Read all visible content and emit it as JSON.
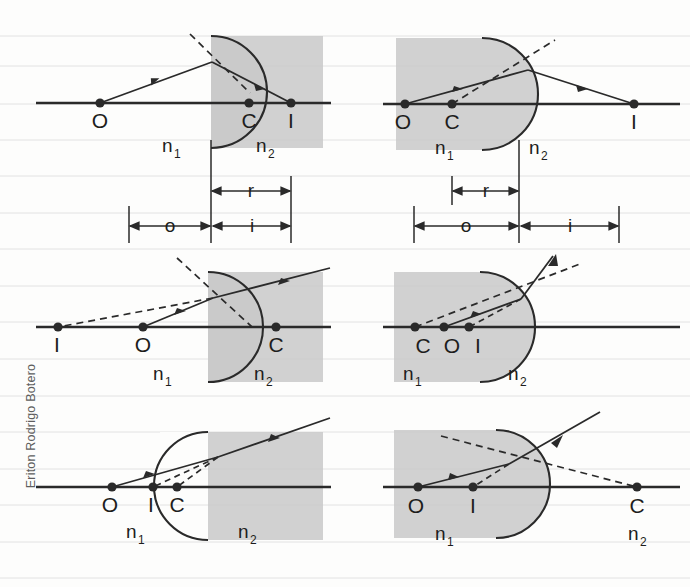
{
  "watermark": {
    "text": "Eriton Rodrigo Botero"
  },
  "figure": {
    "media_labels": {
      "n1": "n",
      "n1_sub": "1",
      "n2": "n",
      "n2_sub": "2"
    },
    "point_labels": {
      "object": "O",
      "center": "C",
      "image": "I"
    },
    "dimension_labels": {
      "object_distance": "o",
      "image_distance": "i",
      "radius": "r"
    }
  },
  "panels": [
    {
      "id": "panel-top-left",
      "position": "top-left",
      "surface": "convex-toward-object",
      "shaded_side": "right",
      "shaded_medium": "n2",
      "points": [
        {
          "name": "O",
          "label": "O",
          "role": "object"
        },
        {
          "name": "C",
          "label": "C",
          "role": "center-of-curvature"
        },
        {
          "name": "I",
          "label": "I",
          "role": "image"
        }
      ],
      "order_on_axis": [
        "O",
        "C",
        "I"
      ],
      "media": [
        {
          "label": "n",
          "sub": "1",
          "side": "left"
        },
        {
          "label": "n",
          "sub": "2",
          "side": "right"
        }
      ],
      "dimensions": [
        {
          "label": "r",
          "from": "vertex",
          "to": "C"
        },
        {
          "label": "o",
          "from": "O",
          "to": "vertex"
        },
        {
          "label": "i",
          "from": "vertex",
          "to": "I"
        }
      ],
      "ray_style": "solid-incident solid-refracted dashed-normal",
      "image_type": "real"
    },
    {
      "id": "panel-top-right",
      "position": "top-right",
      "surface": "convex-away-from-object",
      "shaded_side": "left",
      "shaded_medium": "n1",
      "points": [
        {
          "name": "O",
          "label": "O",
          "role": "object"
        },
        {
          "name": "C",
          "label": "C",
          "role": "center-of-curvature"
        },
        {
          "name": "I",
          "label": "I",
          "role": "image"
        }
      ],
      "order_on_axis": [
        "O",
        "C",
        "I"
      ],
      "media": [
        {
          "label": "n",
          "sub": "1",
          "side": "left"
        },
        {
          "label": "n",
          "sub": "2",
          "side": "right"
        }
      ],
      "dimensions": [
        {
          "label": "r",
          "from": "C",
          "to": "vertex"
        },
        {
          "label": "o",
          "from": "O",
          "to": "vertex"
        },
        {
          "label": "i",
          "from": "vertex",
          "to": "I"
        }
      ],
      "ray_style": "solid-incident solid-refracted dashed-normal",
      "image_type": "real"
    },
    {
      "id": "panel-middle-left",
      "position": "middle-left",
      "surface": "convex-toward-object",
      "shaded_side": "right",
      "shaded_medium": "n2",
      "points": [
        {
          "name": "I",
          "label": "I",
          "role": "image"
        },
        {
          "name": "O",
          "label": "O",
          "role": "object"
        },
        {
          "name": "C",
          "label": "C",
          "role": "center-of-curvature"
        }
      ],
      "order_on_axis": [
        "I",
        "O",
        "C"
      ],
      "media": [
        {
          "label": "n",
          "sub": "1",
          "side": "left"
        },
        {
          "label": "n",
          "sub": "2",
          "side": "right"
        }
      ],
      "dimensions": [],
      "ray_style": "solid-incident solid-refracted dashed-virtual",
      "image_type": "virtual"
    },
    {
      "id": "panel-middle-right",
      "position": "middle-right",
      "surface": "convex-away-from-object",
      "shaded_side": "left",
      "shaded_medium": "n1",
      "points": [
        {
          "name": "C",
          "label": "C",
          "role": "center-of-curvature"
        },
        {
          "name": "O",
          "label": "O",
          "role": "object"
        },
        {
          "name": "I",
          "label": "I",
          "role": "image"
        }
      ],
      "order_on_axis": [
        "C",
        "O",
        "I"
      ],
      "media": [
        {
          "label": "n",
          "sub": "1",
          "side": "left"
        },
        {
          "label": "n",
          "sub": "2",
          "side": "right"
        }
      ],
      "dimensions": [],
      "ray_style": "solid-incident solid-refracted dashed-virtual",
      "image_type": "virtual"
    },
    {
      "id": "panel-bottom-left",
      "position": "bottom-left",
      "surface": "concave-toward-object",
      "shaded_side": "right",
      "shaded_medium": "n2",
      "points": [
        {
          "name": "O",
          "label": "O",
          "role": "object"
        },
        {
          "name": "I",
          "label": "I",
          "role": "image"
        },
        {
          "name": "C",
          "label": "C",
          "role": "center-of-curvature"
        }
      ],
      "order_on_axis": [
        "O",
        "I",
        "C"
      ],
      "media": [
        {
          "label": "n",
          "sub": "1",
          "side": "left"
        },
        {
          "label": "n",
          "sub": "2",
          "side": "right"
        }
      ],
      "dimensions": [],
      "ray_style": "solid-incident solid-refracted dashed-virtual",
      "image_type": "virtual"
    },
    {
      "id": "panel-bottom-right",
      "position": "bottom-right",
      "surface": "convex-away-from-object",
      "shaded_side": "left",
      "shaded_medium": "n1",
      "points": [
        {
          "name": "O",
          "label": "O",
          "role": "object"
        },
        {
          "name": "I",
          "label": "I",
          "role": "image"
        },
        {
          "name": "C",
          "label": "C",
          "role": "center-of-curvature"
        }
      ],
      "order_on_axis": [
        "O",
        "I",
        "C"
      ],
      "media": [
        {
          "label": "n",
          "sub": "1",
          "side": "left"
        },
        {
          "label": "n",
          "sub": "2",
          "side": "right"
        }
      ],
      "dimensions": [],
      "ray_style": "solid-incident solid-refracted dashed-virtual",
      "image_type": "virtual"
    }
  ],
  "colors": {
    "ink": "#1d1d1d",
    "shade": "#c9c9c9",
    "paper": "#fdfdfc",
    "rule": "#dcdcdc",
    "watermark": "#5e5e5e"
  },
  "background": {
    "type": "ruled-scan",
    "rule_count": 14
  }
}
